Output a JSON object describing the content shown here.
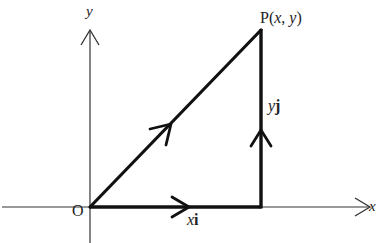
{
  "diagram": {
    "type": "vector-path-diagram",
    "axes": {
      "x_label": "x",
      "y_label": "y",
      "origin_label": "O"
    },
    "point": {
      "label_prefix": "P(",
      "x_var": "x",
      "sep": ", ",
      "y_var": "y",
      "label_suffix": ")"
    },
    "vectors": [
      {
        "name": "xi",
        "var": "x",
        "unit": "i",
        "direction": "right"
      },
      {
        "name": "yj",
        "var": "y",
        "unit": "j",
        "direction": "up"
      },
      {
        "name": "OP",
        "direction": "diagonal-up-right"
      }
    ],
    "colors": {
      "line": "#111111",
      "axis": "#333333",
      "background": "#ffffff"
    }
  }
}
